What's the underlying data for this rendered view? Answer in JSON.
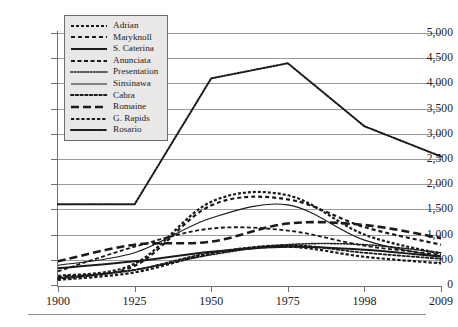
{
  "chart_data": {
    "type": "line",
    "title": "",
    "xlabel": "",
    "ylabel": "",
    "x": [
      1900,
      1925,
      1950,
      1975,
      1998,
      2009
    ],
    "xlim": [
      1900,
      2009
    ],
    "ylim": [
      0,
      5000
    ],
    "yticks": [
      0,
      500,
      1000,
      1500,
      2000,
      2500,
      3000,
      3500,
      4000,
      4500,
      5000
    ],
    "ytick_labels": [
      "0",
      "500",
      "1,000",
      "1,500",
      "2,000",
      "2,500",
      "3,000",
      "3,500",
      "4,000",
      "4,500",
      "5,000"
    ],
    "xtick_labels": [
      "1900",
      "1925",
      "1950",
      "1975",
      "1998",
      "2009"
    ],
    "grid": true,
    "legend_position": "upper-left",
    "series": [
      {
        "name": "Adrian",
        "dash": "dotted-square",
        "width": 2.2,
        "values": [
          180,
          420,
          1650,
          1780,
          1000,
          620
        ]
      },
      {
        "name": "Maryknoll",
        "dash": "dashed-thick",
        "width": 2.2,
        "values": [
          160,
          380,
          1580,
          1700,
          1150,
          800
        ]
      },
      {
        "name": "S. Caterina",
        "dash": "solid-thick",
        "width": 2.0,
        "values": [
          330,
          470,
          660,
          760,
          700,
          560
        ]
      },
      {
        "name": "Anunciata",
        "dash": "dashed-medium",
        "width": 1.8,
        "values": [
          270,
          760,
          1120,
          1080,
          780,
          600
        ]
      },
      {
        "name": "Presentation",
        "dash": "fine-dotted",
        "width": 1.6,
        "values": [
          140,
          300,
          600,
          800,
          800,
          640
        ]
      },
      {
        "name": "Sinsinawa",
        "dash": "solid-thin",
        "width": 1.2,
        "values": [
          390,
          640,
          1330,
          1590,
          890,
          560
        ]
      },
      {
        "name": "Cabra",
        "dash": "dotted-round",
        "width": 1.8,
        "values": [
          120,
          300,
          640,
          790,
          640,
          520
        ]
      },
      {
        "name": "Romaine",
        "dash": "dash-long",
        "width": 2.6,
        "values": [
          470,
          800,
          860,
          1220,
          1190,
          930
        ]
      },
      {
        "name": "G. Rapids",
        "dash": "dotted-square2",
        "width": 2.2,
        "values": [
          100,
          250,
          620,
          760,
          560,
          430
        ]
      },
      {
        "name": "Rosario",
        "dash": "dotted-dense",
        "width": 2.0,
        "values": [
          1600,
          1600,
          4100,
          4400,
          3150,
          2550
        ]
      }
    ]
  },
  "legend": {
    "items": [
      {
        "label": "Adrian"
      },
      {
        "label": "Maryknoll"
      },
      {
        "label": "S. Caterina"
      },
      {
        "label": "Anunciata"
      },
      {
        "label": "Presentation"
      },
      {
        "label": "Sinsinawa"
      },
      {
        "label": "Cabra"
      },
      {
        "label": "Romaine"
      },
      {
        "label": "G. Rapids"
      },
      {
        "label": "Rosario"
      }
    ]
  },
  "colors": {
    "series": "#1a1a1a",
    "grid": "#9a9a9a",
    "axis": "#6f6f6f",
    "legend_bg": "#e9e8e6",
    "legend_border": "#6d6d6d",
    "text": "#1c1c1c"
  }
}
